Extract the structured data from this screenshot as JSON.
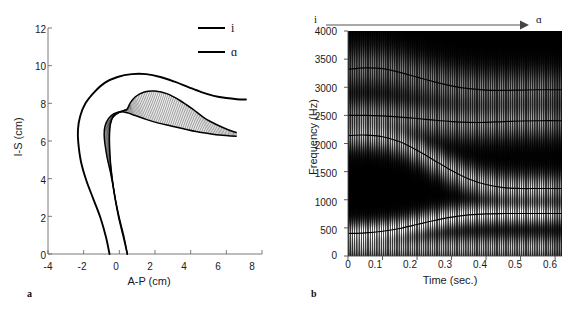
{
  "figure": {
    "panels": [
      {
        "letter": "a",
        "type": "vocal-tract-profile",
        "xlabel": "A-P (cm)",
        "ylabel": "I-S (cm)",
        "xticks": [
          "-4",
          "-2",
          "0",
          "2",
          "4",
          "6",
          "8"
        ],
        "yticks": [
          "0",
          "2",
          "4",
          "6",
          "8",
          "10",
          "12"
        ],
        "legend": [
          {
            "label": "i",
            "color": "#000000"
          },
          {
            "label": "ɑ",
            "color": "#000000"
          }
        ]
      },
      {
        "letter": "b",
        "type": "spectrogram",
        "xlabel": "Time (sec.)",
        "ylabel": "Frequency (Hz)",
        "xticks": [
          "0",
          "0.1",
          "0.2",
          "0.3",
          "0.4",
          "0.5",
          "0.6"
        ],
        "yticks": [
          "0",
          "500",
          "1000",
          "1500",
          "2000",
          "2500",
          "3000",
          "3500",
          "4000"
        ],
        "annotation": {
          "start_label": "i",
          "end_label": "ɑ",
          "arrow": "arrow-right-icon"
        }
      }
    ]
  },
  "chart_data": [
    {
      "type": "line",
      "id": "panel-a-vocal-tract",
      "title": "",
      "xlabel": "A-P (cm)",
      "ylabel": "I-S (cm)",
      "xlim": [
        -4,
        8
      ],
      "ylim": [
        0,
        12
      ],
      "xticks": [
        -4,
        -2,
        0,
        2,
        4,
        6,
        8
      ],
      "yticks": [
        0,
        2,
        4,
        6,
        8,
        10,
        12
      ],
      "grid": false,
      "legend": [
        "i",
        "ɑ"
      ],
      "legend_position": "top-right",
      "series": [
        {
          "name": "outer tract wall (pharynx-palate-lips)",
          "x": [
            -0.55,
            -0.75,
            -1.05,
            -1.45,
            -1.85,
            -2.15,
            -2.3,
            -2.32,
            -2.2,
            -1.9,
            -1.4,
            -0.8,
            -0.1,
            0.7,
            1.5,
            2.3,
            3.1,
            3.9,
            4.6,
            5.3,
            6.0,
            6.6,
            7.1
          ],
          "y": [
            0.0,
            0.9,
            1.9,
            2.9,
            3.9,
            4.9,
            5.9,
            6.6,
            7.3,
            8.0,
            8.6,
            9.1,
            9.4,
            9.55,
            9.55,
            9.4,
            9.15,
            8.85,
            8.6,
            8.4,
            8.28,
            8.22,
            8.2
          ]
        },
        {
          "name": "inner contour / tongue surface (i)",
          "x": [
            0.45,
            0.2,
            -0.05,
            -0.25,
            -0.4,
            -0.5,
            -0.55,
            -0.55,
            -0.5,
            -0.35,
            -0.1,
            0.2,
            0.4,
            0.45,
            0.5,
            0.6,
            0.9,
            1.4,
            2.0,
            2.7,
            3.4,
            4.1,
            4.8,
            5.5,
            6.1,
            6.55
          ],
          "y": [
            0.0,
            1.0,
            2.0,
            3.0,
            4.0,
            4.9,
            5.8,
            6.4,
            6.9,
            7.3,
            7.5,
            7.6,
            7.65,
            7.7,
            7.8,
            8.0,
            8.35,
            8.6,
            8.65,
            8.5,
            8.15,
            7.7,
            7.2,
            6.85,
            6.6,
            6.45
          ]
        },
        {
          "name": "tongue body boundary (ɑ)",
          "x": [
            0.45,
            0.25,
            0.0,
            -0.2,
            -0.35,
            -0.5,
            -0.68,
            -0.8,
            -0.85,
            -0.8,
            -0.6,
            -0.3,
            0.1,
            0.45,
            0.9,
            1.5,
            2.2,
            2.9,
            3.6,
            4.3,
            5.0,
            5.6,
            6.1,
            6.55
          ],
          "y": [
            0.0,
            0.95,
            1.9,
            2.8,
            3.6,
            4.35,
            5.1,
            5.8,
            6.35,
            6.8,
            7.2,
            7.45,
            7.55,
            7.5,
            7.35,
            7.15,
            6.95,
            6.8,
            6.65,
            6.5,
            6.4,
            6.32,
            6.28,
            6.25
          ]
        }
      ],
      "hatching": {
        "present": true,
        "orientation": "horizontal",
        "description": "dense horizontal grid lines filling the area between the inner contour and tongue body boundary, representing interpolated vocal tract shapes between /i/ and /ɑ/"
      }
    },
    {
      "type": "heatmap",
      "id": "panel-b-spectrogram",
      "title": "",
      "xlabel": "Time (sec.)",
      "ylabel": "Frequency (Hz)",
      "xlim": [
        0,
        0.62
      ],
      "ylim": [
        0,
        4000
      ],
      "xticks": [
        0,
        0.1,
        0.2,
        0.3,
        0.4,
        0.5,
        0.6
      ],
      "yticks": [
        0,
        500,
        1000,
        1500,
        2000,
        2500,
        3000,
        3500,
        4000
      ],
      "grid": false,
      "colormap": "gray-inverted (dark = low energy, light = high energy)",
      "annotations": [
        {
          "text": "i",
          "position": "top-left"
        },
        {
          "text": "ɑ",
          "position": "top-right"
        },
        {
          "text": "arrow-right-icon",
          "position": "top-center"
        }
      ],
      "striations": {
        "type": "glottal-pulse-vertical",
        "approx_period_sec": 0.0053,
        "approx_f0_hz": 190
      },
      "formant_tracks": [
        {
          "name": "F1",
          "t": [
            0.0,
            0.05,
            0.1,
            0.15,
            0.2,
            0.25,
            0.3,
            0.35,
            0.4,
            0.45,
            0.5,
            0.55,
            0.62
          ],
          "f": [
            400,
            410,
            440,
            490,
            560,
            630,
            690,
            730,
            750,
            755,
            755,
            755,
            755
          ]
        },
        {
          "name": "F2",
          "t": [
            0.0,
            0.05,
            0.1,
            0.15,
            0.2,
            0.25,
            0.3,
            0.35,
            0.4,
            0.45,
            0.5,
            0.55,
            0.62
          ],
          "f": [
            2140,
            2150,
            2120,
            2030,
            1880,
            1700,
            1520,
            1370,
            1270,
            1215,
            1200,
            1200,
            1200
          ]
        },
        {
          "name": "F3",
          "t": [
            0.0,
            0.05,
            0.1,
            0.15,
            0.2,
            0.25,
            0.3,
            0.35,
            0.4,
            0.45,
            0.5,
            0.55,
            0.62
          ],
          "f": [
            2500,
            2500,
            2490,
            2470,
            2445,
            2415,
            2390,
            2375,
            2375,
            2390,
            2400,
            2405,
            2405
          ]
        },
        {
          "name": "F4",
          "t": [
            0.0,
            0.05,
            0.1,
            0.15,
            0.2,
            0.25,
            0.3,
            0.35,
            0.4,
            0.45,
            0.5,
            0.55,
            0.62
          ],
          "f": [
            3320,
            3345,
            3330,
            3265,
            3180,
            3095,
            3025,
            2975,
            2950,
            2945,
            2950,
            2955,
            2955
          ]
        }
      ],
      "formant_bands": [
        {
          "name": "F1 band",
          "start_hz": 400,
          "end_hz": 755
        },
        {
          "name": "F2 band",
          "start_hz": 2140,
          "end_hz": 1200
        },
        {
          "name": "F3 band",
          "start_hz": 2500,
          "end_hz": 2405
        },
        {
          "name": "F4 band",
          "start_hz": 3320,
          "end_hz": 2955
        }
      ]
    }
  ]
}
